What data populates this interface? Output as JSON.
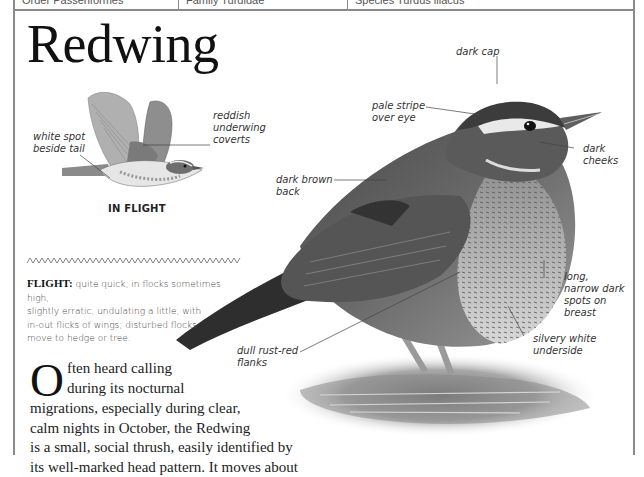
{
  "header": {
    "cells": [
      {
        "label": "Order Passeriformes"
      },
      {
        "label": "Family Turdidae"
      },
      {
        "label": "Species Turdus iliacus"
      }
    ]
  },
  "title": "Redwing",
  "flight_illustration": {
    "caption": "IN FLIGHT",
    "labels": {
      "white_spot": [
        "white spot",
        "beside tail"
      ],
      "underwing": [
        "reddish",
        "underwing",
        "coverts"
      ]
    }
  },
  "main_illustration": {
    "labels": {
      "dark_cap": [
        "dark cap"
      ],
      "pale_stripe": [
        "pale stripe",
        "over eye"
      ],
      "dark_cheeks": [
        "dark",
        "cheeks"
      ],
      "dark_back": [
        "dark brown",
        "back"
      ],
      "breast_spots": [
        "long,",
        "narrow dark",
        "spots on",
        "breast"
      ],
      "underside": [
        "silvery white",
        "underside"
      ],
      "flanks": [
        "dull rust-red",
        "flanks"
      ]
    }
  },
  "flight_text": {
    "heading": "FLIGHT:",
    "lines": [
      " quite quick; in flocks sometimes high,",
      "slightly erratic, undulating a little, with",
      "in-out flicks of wings; disturbed flocks",
      "move to hedge or tree."
    ]
  },
  "description": {
    "dropcap": "O",
    "lines": [
      "ften heard calling",
      "during its nocturnal",
      "migrations, especially during clear,",
      "calm nights in October, the Redwing",
      "is a small, social thrush, easily identified by",
      "its well-marked head pattern. It moves about"
    ]
  },
  "colors": {
    "border": "#8a8a8a",
    "title": "#111111",
    "label": "#333333"
  }
}
